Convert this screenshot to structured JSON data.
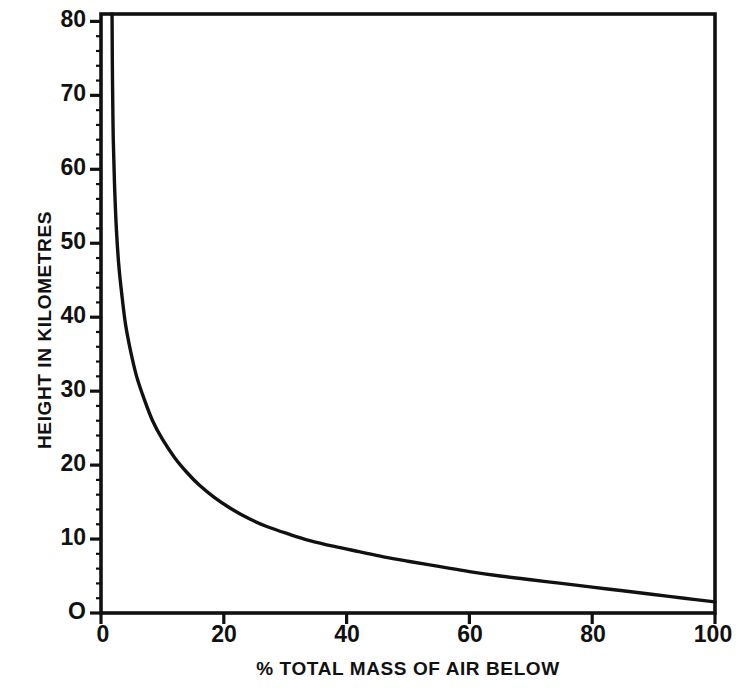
{
  "chart_data": {
    "type": "line",
    "title": "",
    "xlabel": "% TOTAL MASS OF AIR BELOW",
    "ylabel": "HEIGHT IN KILOMETRES",
    "xlim": [
      0,
      100
    ],
    "ylim": [
      0,
      81
    ],
    "xticks": [
      0,
      20,
      40,
      60,
      80,
      100
    ],
    "xtick_labels": [
      "0",
      "20",
      "40",
      "60",
      "80",
      "100"
    ],
    "yticks": [
      0,
      10,
      20,
      30,
      40,
      50,
      60,
      70,
      80
    ],
    "ytick_labels": [
      "O",
      "10",
      "20",
      "30",
      "40",
      "50",
      "60",
      "70",
      "80"
    ],
    "minor_tick_interval_y": 2,
    "grid": false,
    "legend": null,
    "line_color": "#111111",
    "axis_color": "#111111",
    "background_color": "#ffffff",
    "series": [
      {
        "name": "Height vs cumulative mass of air below",
        "x": [
          1.8,
          1.85,
          1.9,
          2.0,
          2.2,
          2.5,
          2.9,
          3.4,
          4.0,
          4.8,
          5.8,
          7.0,
          8.4,
          10.0,
          12.0,
          14.0,
          16.0,
          18.5,
          21.0,
          24.0,
          27.0,
          30.5,
          34.0,
          38.0,
          42.0,
          46.0,
          50.0,
          55.0,
          60.0,
          65.0,
          70.0,
          75.0,
          80.0,
          85.0,
          90.0,
          95.0,
          100.0
        ],
        "y": [
          81.0,
          74.0,
          70.0,
          64.0,
          58.0,
          52.0,
          47.0,
          43.0,
          39.0,
          35.5,
          32.0,
          29.0,
          26.0,
          23.5,
          21.0,
          19.0,
          17.3,
          15.6,
          14.2,
          12.8,
          11.7,
          10.7,
          9.8,
          9.0,
          8.3,
          7.6,
          7.0,
          6.3,
          5.6,
          5.0,
          4.5,
          4.0,
          3.5,
          3.0,
          2.5,
          2.0,
          1.5
        ]
      }
    ]
  },
  "axes": {
    "frame_color": "#111111"
  }
}
